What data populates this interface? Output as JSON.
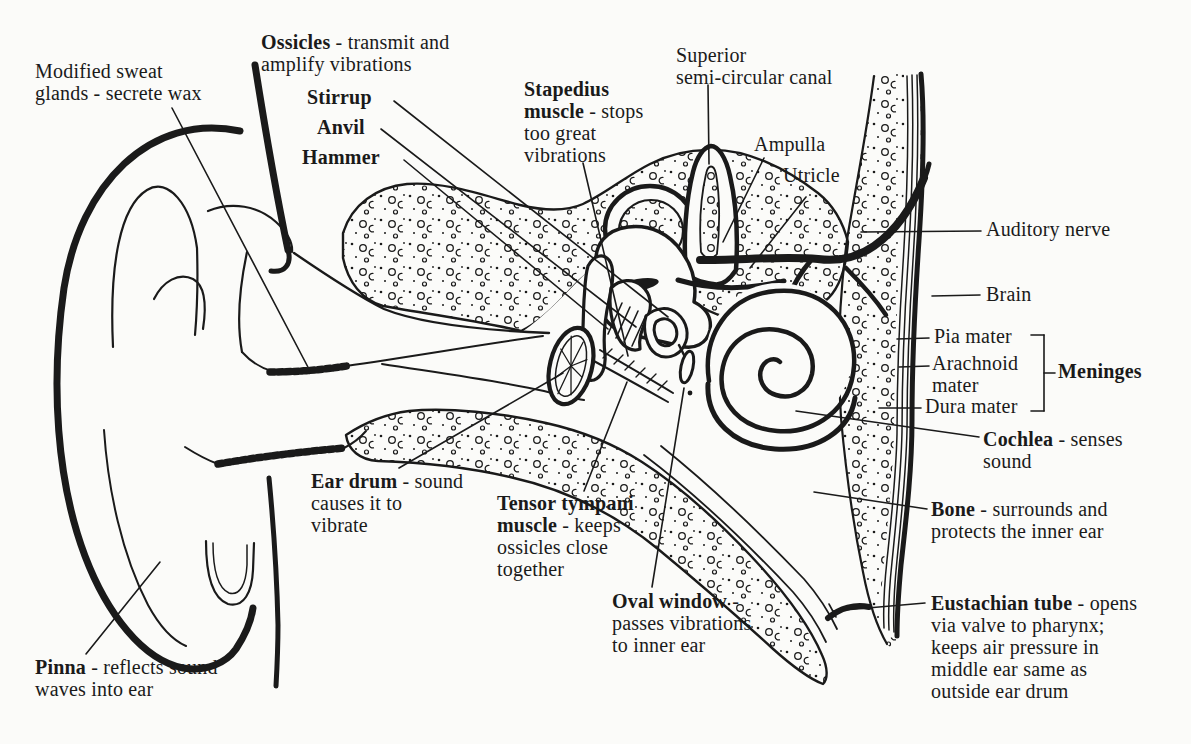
{
  "canvas": {
    "width": 1191,
    "height": 744,
    "background": "#fbfbf9",
    "ink": "#1a1a1a"
  },
  "figure": {
    "type": "anatomical-line-diagram"
  },
  "labels": [
    {
      "id": "modified-sweat-glands",
      "x": 35,
      "y": 60,
      "lines": [
        [
          {
            "t": "Modified sweat",
            "b": false
          }
        ],
        [
          {
            "t": "glands - secrete wax",
            "b": false
          }
        ]
      ]
    },
    {
      "id": "ossicles",
      "x": 261,
      "y": 31,
      "lines": [
        [
          {
            "t": "Ossicles",
            "b": true
          },
          {
            "t": " - transmit and",
            "b": false
          }
        ],
        [
          {
            "t": "amplify vibrations",
            "b": false
          }
        ]
      ]
    },
    {
      "id": "stirrup",
      "x": 307,
      "y": 86,
      "lines": [
        [
          {
            "t": "Stirrup",
            "b": true
          }
        ]
      ]
    },
    {
      "id": "anvil",
      "x": 317,
      "y": 116,
      "lines": [
        [
          {
            "t": "Anvil",
            "b": true
          }
        ]
      ]
    },
    {
      "id": "hammer",
      "x": 302,
      "y": 146,
      "lines": [
        [
          {
            "t": "Hammer",
            "b": true
          }
        ]
      ]
    },
    {
      "id": "stapedius-muscle",
      "x": 524,
      "y": 78,
      "lines": [
        [
          {
            "t": "Stapedius",
            "b": true
          }
        ],
        [
          {
            "t": "muscle",
            "b": true
          },
          {
            "t": " - stops",
            "b": false
          }
        ],
        [
          {
            "t": "too great",
            "b": false
          }
        ],
        [
          {
            "t": "vibrations",
            "b": false
          }
        ]
      ]
    },
    {
      "id": "superior-semicircular-canal",
      "x": 676,
      "y": 44,
      "lines": [
        [
          {
            "t": "Superior",
            "b": false
          }
        ],
        [
          {
            "t": "semi-circular canal",
            "b": false
          }
        ]
      ]
    },
    {
      "id": "ampulla",
      "x": 754,
      "y": 133,
      "lines": [
        [
          {
            "t": "Ampulla",
            "b": false
          }
        ]
      ]
    },
    {
      "id": "utricle",
      "x": 783,
      "y": 164,
      "lines": [
        [
          {
            "t": "Utricle",
            "b": false
          }
        ]
      ]
    },
    {
      "id": "auditory-nerve",
      "x": 986,
      "y": 218,
      "lines": [
        [
          {
            "t": "Auditory nerve",
            "b": false
          }
        ]
      ]
    },
    {
      "id": "brain",
      "x": 986,
      "y": 283,
      "lines": [
        [
          {
            "t": "Brain",
            "b": false
          }
        ]
      ]
    },
    {
      "id": "pia-mater",
      "x": 934,
      "y": 325,
      "lines": [
        [
          {
            "t": "Pia mater",
            "b": false
          }
        ]
      ]
    },
    {
      "id": "arachnoid-mater",
      "x": 932,
      "y": 352,
      "lines": [
        [
          {
            "t": "Arachnoid",
            "b": false
          }
        ],
        [
          {
            "t": "mater",
            "b": false
          }
        ]
      ]
    },
    {
      "id": "dura-mater",
      "x": 925,
      "y": 395,
      "lines": [
        [
          {
            "t": "Dura mater",
            "b": false
          }
        ]
      ]
    },
    {
      "id": "meninges",
      "x": 1058,
      "y": 360,
      "lines": [
        [
          {
            "t": "Meninges",
            "b": true
          }
        ]
      ]
    },
    {
      "id": "cochlea",
      "x": 983,
      "y": 428,
      "lines": [
        [
          {
            "t": "Cochlea",
            "b": true
          },
          {
            "t": " - senses",
            "b": false
          }
        ],
        [
          {
            "t": "sound",
            "b": false
          }
        ]
      ]
    },
    {
      "id": "bone",
      "x": 931,
      "y": 498,
      "lines": [
        [
          {
            "t": "Bone",
            "b": true
          },
          {
            "t": " - surrounds and",
            "b": false
          }
        ],
        [
          {
            "t": "protects the inner ear",
            "b": false
          }
        ]
      ]
    },
    {
      "id": "eustachian-tube",
      "x": 931,
      "y": 592,
      "lines": [
        [
          {
            "t": "Eustachian tube",
            "b": true
          },
          {
            "t": " - opens",
            "b": false
          }
        ],
        [
          {
            "t": "via valve to pharynx;",
            "b": false
          }
        ],
        [
          {
            "t": "keeps air pressure in",
            "b": false
          }
        ],
        [
          {
            "t": "middle ear same as",
            "b": false
          }
        ],
        [
          {
            "t": "outside ear drum",
            "b": false
          }
        ]
      ]
    },
    {
      "id": "oval-window",
      "x": 612,
      "y": 590,
      "lines": [
        [
          {
            "t": "Oval window",
            "b": true
          },
          {
            "t": " -",
            "b": false
          }
        ],
        [
          {
            "t": "passes vibrations",
            "b": false
          }
        ],
        [
          {
            "t": "to inner ear",
            "b": false
          }
        ]
      ]
    },
    {
      "id": "tensor-tympani-muscle",
      "x": 497,
      "y": 492,
      "lines": [
        [
          {
            "t": "Tensor tympani",
            "b": true
          }
        ],
        [
          {
            "t": "muscle",
            "b": true
          },
          {
            "t": " - keeps",
            "b": false
          }
        ],
        [
          {
            "t": "ossicles close",
            "b": false
          }
        ],
        [
          {
            "t": "together",
            "b": false
          }
        ]
      ]
    },
    {
      "id": "ear-drum",
      "x": 311,
      "y": 470,
      "lines": [
        [
          {
            "t": "Ear drum",
            "b": true
          },
          {
            "t": " - sound",
            "b": false
          }
        ],
        [
          {
            "t": "causes it to",
            "b": false
          }
        ],
        [
          {
            "t": "vibrate",
            "b": false
          }
        ]
      ]
    },
    {
      "id": "pinna",
      "x": 35,
      "y": 656,
      "lines": [
        [
          {
            "t": "Pinna",
            "b": true
          },
          {
            "t": " - reflects sound",
            "b": false
          }
        ],
        [
          {
            "t": "waves into ear",
            "b": false
          }
        ]
      ]
    }
  ],
  "leader_lines": [
    {
      "name": "leader-modified-sweat-glands",
      "x1": 172,
      "y1": 108,
      "x2": 310,
      "y2": 371
    },
    {
      "name": "leader-stirrup",
      "x1": 394,
      "y1": 101,
      "x2": 668,
      "y2": 317
    },
    {
      "name": "leader-anvil",
      "x1": 381,
      "y1": 129,
      "x2": 636,
      "y2": 327
    },
    {
      "name": "leader-hammer",
      "x1": 404,
      "y1": 160,
      "x2": 608,
      "y2": 329
    },
    {
      "name": "leader-stapedius-muscle",
      "x1": 583,
      "y1": 163,
      "x2": 628,
      "y2": 356
    },
    {
      "name": "leader-superior-canal",
      "x1": 708,
      "y1": 85,
      "x2": 709,
      "y2": 164
    },
    {
      "name": "leader-ampulla",
      "x1": 764,
      "y1": 158,
      "x2": 723,
      "y2": 242
    },
    {
      "name": "leader-utricle",
      "x1": 806,
      "y1": 197,
      "x2": 750,
      "y2": 268
    },
    {
      "name": "leader-auditory-nerve",
      "x1": 861,
      "y1": 232,
      "x2": 981,
      "y2": 231
    },
    {
      "name": "leader-brain",
      "x1": 932,
      "y1": 296,
      "x2": 980,
      "y2": 295
    },
    {
      "name": "leader-pia-mater",
      "x1": 897,
      "y1": 339,
      "x2": 929,
      "y2": 338
    },
    {
      "name": "leader-arachnoid-mater",
      "x1": 899,
      "y1": 367,
      "x2": 929,
      "y2": 366
    },
    {
      "name": "leader-dura-mater",
      "x1": 879,
      "y1": 408,
      "x2": 921,
      "y2": 408
    },
    {
      "name": "meninges-bracket-top",
      "x1": 1031,
      "y1": 335,
      "x2": 1044,
      "y2": 335
    },
    {
      "name": "meninges-bracket-stem",
      "x1": 1044,
      "y1": 335,
      "x2": 1044,
      "y2": 411
    },
    {
      "name": "meninges-bracket-bottom",
      "x1": 1044,
      "y1": 411,
      "x2": 1031,
      "y2": 411
    },
    {
      "name": "meninges-bracket-pointer",
      "x1": 1044,
      "y1": 373,
      "x2": 1055,
      "y2": 373
    },
    {
      "name": "leader-cochlea",
      "x1": 796,
      "y1": 411,
      "x2": 979,
      "y2": 437
    },
    {
      "name": "leader-bone",
      "x1": 814,
      "y1": 492,
      "x2": 927,
      "y2": 509
    },
    {
      "name": "leader-eustachian-tube",
      "x1": 833,
      "y1": 611,
      "x2": 925,
      "y2": 603
    },
    {
      "name": "leader-eustachian-tick",
      "x1": 829,
      "y1": 604,
      "x2": 836,
      "y2": 617
    },
    {
      "name": "leader-oval-window",
      "x1": 684,
      "y1": 388,
      "x2": 652,
      "y2": 587
    },
    {
      "name": "leader-tensor-tympani",
      "x1": 627,
      "y1": 382,
      "x2": 584,
      "y2": 491
    },
    {
      "name": "leader-ear-drum",
      "x1": 563,
      "y1": 373,
      "x2": 399,
      "y2": 468
    },
    {
      "name": "leader-pinna",
      "x1": 160,
      "y1": 562,
      "x2": 86,
      "y2": 654
    }
  ]
}
